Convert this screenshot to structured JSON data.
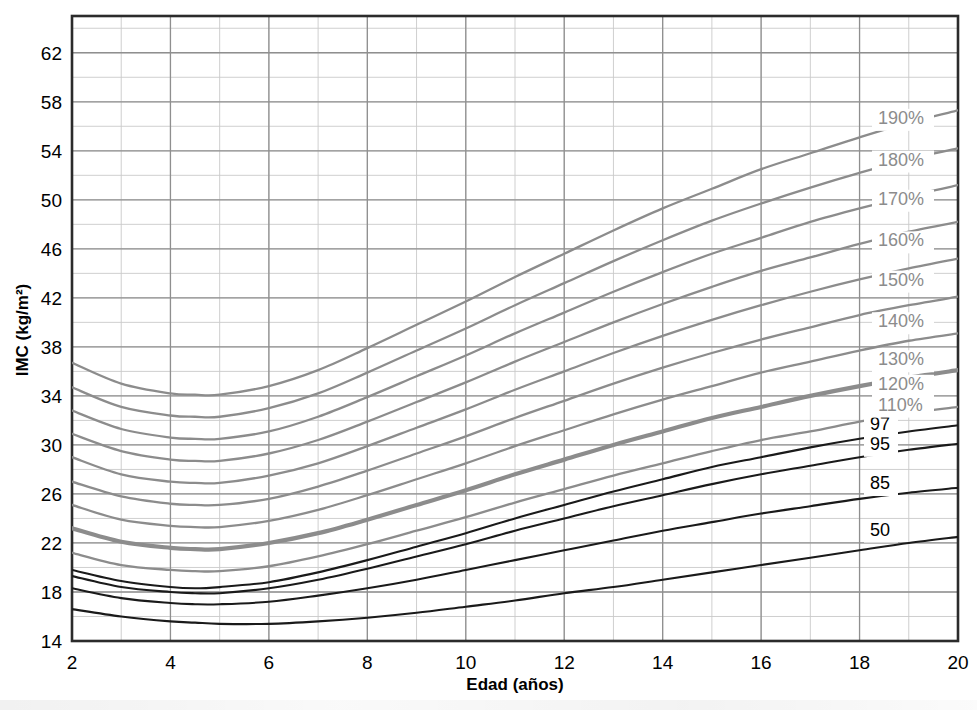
{
  "chart_data": {
    "type": "line",
    "title": "",
    "xlabel": "Edad (años)",
    "ylabel": "IMC (kg/m²)",
    "xlim": [
      2,
      20
    ],
    "ylim": [
      14,
      65
    ],
    "xticks": [
      2,
      4,
      6,
      8,
      10,
      12,
      14,
      16,
      18,
      20
    ],
    "xtick_labels": [
      "2",
      "4",
      "6",
      "8",
      "10",
      "12",
      "14",
      "16",
      "18",
      "20"
    ],
    "yticks": [
      14,
      18,
      22,
      26,
      30,
      34,
      38,
      42,
      46,
      50,
      54,
      58,
      62
    ],
    "ytick_labels": [
      "14",
      "18",
      "22",
      "26",
      "30",
      "34",
      "38",
      "42",
      "46",
      "50",
      "54",
      "58",
      "62"
    ],
    "grid": true,
    "grid_minor_x_step": 1,
    "grid_minor_y_step": 2,
    "legend_position": "right-inline",
    "x": [
      2,
      3,
      4,
      4.5,
      5,
      6,
      7,
      8,
      9,
      10,
      11,
      12,
      13,
      14,
      15,
      16,
      17,
      18,
      19,
      20
    ],
    "series": [
      {
        "name": "50",
        "label": "50",
        "kind": "percentile",
        "color": "#1a1a1a",
        "width": 2.1,
        "label_y": 22.6,
        "values": [
          16.6,
          16.0,
          15.6,
          15.5,
          15.4,
          15.4,
          15.6,
          15.9,
          16.3,
          16.8,
          17.3,
          17.9,
          18.4,
          19.0,
          19.6,
          20.2,
          20.8,
          21.4,
          22.0,
          22.5
        ]
      },
      {
        "name": "85",
        "label": "85",
        "kind": "percentile",
        "color": "#1a1a1a",
        "width": 2.1,
        "label_y": 26.4,
        "values": [
          18.3,
          17.5,
          17.1,
          17.0,
          17.0,
          17.2,
          17.7,
          18.3,
          19.0,
          19.8,
          20.6,
          21.4,
          22.2,
          23.0,
          23.7,
          24.4,
          25.0,
          25.6,
          26.1,
          26.5
        ]
      },
      {
        "name": "95",
        "label": "95",
        "kind": "percentile",
        "color": "#1a1a1a",
        "width": 2.1,
        "label_y": 29.6,
        "values": [
          19.3,
          18.4,
          18.0,
          17.9,
          17.9,
          18.3,
          19.0,
          19.9,
          20.9,
          21.9,
          23.0,
          24.0,
          25.0,
          25.9,
          26.8,
          27.6,
          28.3,
          29.0,
          29.6,
          30.1
        ]
      },
      {
        "name": "97",
        "label": "97",
        "kind": "percentile",
        "color": "#1a1a1a",
        "width": 2.1,
        "label_y": 31.2,
        "values": [
          19.8,
          18.9,
          18.4,
          18.3,
          18.4,
          18.8,
          19.6,
          20.6,
          21.7,
          22.8,
          24.0,
          25.1,
          26.2,
          27.2,
          28.2,
          29.0,
          29.8,
          30.5,
          31.1,
          31.6
        ]
      },
      {
        "name": "110%",
        "label": "110%",
        "kind": "percent-of-95th",
        "color": "#8c8c8c",
        "width": 2.3,
        "label_y": 32.8,
        "values": [
          21.2,
          20.2,
          19.8,
          19.7,
          19.7,
          20.1,
          20.9,
          21.9,
          23.0,
          24.1,
          25.3,
          26.4,
          27.5,
          28.5,
          29.5,
          30.4,
          31.1,
          31.9,
          32.6,
          33.1
        ]
      },
      {
        "name": "120%",
        "label": "120%",
        "kind": "percent-of-95th",
        "color": "#8c8c8c",
        "width": 4.2,
        "label_y": 34.5,
        "values": [
          23.2,
          22.1,
          21.6,
          21.5,
          21.5,
          22.0,
          22.8,
          23.9,
          25.1,
          26.3,
          27.6,
          28.8,
          30.0,
          31.1,
          32.2,
          33.1,
          34.0,
          34.8,
          35.5,
          36.1
        ]
      },
      {
        "name": "130%",
        "label": "130%",
        "kind": "percent-of-95th",
        "color": "#8c8c8c",
        "width": 2.3,
        "label_y": 36.5,
        "values": [
          25.1,
          23.9,
          23.4,
          23.3,
          23.3,
          23.8,
          24.7,
          25.9,
          27.2,
          28.5,
          29.9,
          31.2,
          32.5,
          33.7,
          34.8,
          35.9,
          36.8,
          37.7,
          38.5,
          39.1
        ]
      },
      {
        "name": "140%",
        "label": "140%",
        "kind": "percent-of-95th",
        "color": "#8c8c8c",
        "width": 2.3,
        "label_y": 39.6,
        "values": [
          27.0,
          25.8,
          25.2,
          25.1,
          25.1,
          25.6,
          26.6,
          27.9,
          29.3,
          30.7,
          32.2,
          33.6,
          35.0,
          36.3,
          37.5,
          38.6,
          39.6,
          40.6,
          41.4,
          42.1
        ]
      },
      {
        "name": "150%",
        "label": "150%",
        "kind": "percent-of-95th",
        "color": "#8c8c8c",
        "width": 2.3,
        "label_y": 43.0,
        "values": [
          29.0,
          27.6,
          27.0,
          26.9,
          26.9,
          27.5,
          28.5,
          29.9,
          31.4,
          32.9,
          34.5,
          36.0,
          37.5,
          38.9,
          40.2,
          41.4,
          42.5,
          43.5,
          44.4,
          45.2
        ]
      },
      {
        "name": "160%",
        "label": "160%",
        "kind": "percent-of-95th",
        "color": "#8c8c8c",
        "width": 2.3,
        "label_y": 46.2,
        "values": [
          30.9,
          29.5,
          28.8,
          28.7,
          28.7,
          29.3,
          30.4,
          31.9,
          33.5,
          35.1,
          36.8,
          38.4,
          40.0,
          41.5,
          42.9,
          44.2,
          45.3,
          46.4,
          47.4,
          48.2
        ]
      },
      {
        "name": "170%",
        "label": "170%",
        "kind": "percent-of-95th",
        "color": "#8c8c8c",
        "width": 2.3,
        "label_y": 49.6,
        "values": [
          32.8,
          31.3,
          30.6,
          30.5,
          30.5,
          31.1,
          32.3,
          33.9,
          35.6,
          37.3,
          39.1,
          40.8,
          42.5,
          44.1,
          45.6,
          46.9,
          48.2,
          49.3,
          50.3,
          51.2
        ]
      },
      {
        "name": "180%",
        "label": "180%",
        "kind": "percent-of-95th",
        "color": "#8c8c8c",
        "width": 2.3,
        "label_y": 52.8,
        "values": [
          34.7,
          33.1,
          32.4,
          32.3,
          32.3,
          33.0,
          34.2,
          35.9,
          37.7,
          39.5,
          41.4,
          43.2,
          45.0,
          46.7,
          48.3,
          49.7,
          51.0,
          52.2,
          53.3,
          54.2
        ]
      },
      {
        "name": "190%",
        "label": "190%",
        "kind": "percent-of-95th",
        "color": "#8c8c8c",
        "width": 2.3,
        "label_y": 56.2,
        "values": [
          36.7,
          35.0,
          34.2,
          34.1,
          34.1,
          34.8,
          36.1,
          37.9,
          39.8,
          41.7,
          43.7,
          45.6,
          47.5,
          49.3,
          50.9,
          52.5,
          53.8,
          55.1,
          56.3,
          57.3
        ]
      }
    ]
  },
  "axes": {
    "x_axis_title": "Edad (años)",
    "y_axis_title": "IMC (kg/m²)"
  }
}
